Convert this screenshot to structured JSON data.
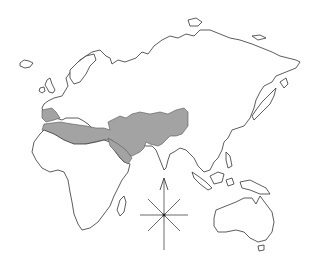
{
  "map": {
    "title": "Map of Eurasia, Africa and Australia with highlighted region",
    "background_color": "#ffffff",
    "outline_color": "#333333",
    "highlight_color": "#a3a3a3",
    "highlighted_region": "North Africa, Iberia, Middle East and Central Asia",
    "regions": [
      {
        "name": "Europe"
      },
      {
        "name": "Asia"
      },
      {
        "name": "Africa"
      },
      {
        "name": "Arabian Peninsula"
      },
      {
        "name": "Indian Subcontinent"
      },
      {
        "name": "Southeast Asia"
      },
      {
        "name": "Japan"
      },
      {
        "name": "Australia"
      },
      {
        "name": "Madagascar"
      },
      {
        "name": "British Isles"
      },
      {
        "name": "Iceland"
      }
    ],
    "compass": {
      "direction_indicator": "N arrow",
      "points": 8
    }
  }
}
